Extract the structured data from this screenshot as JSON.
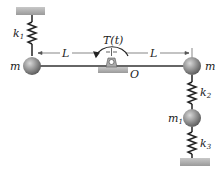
{
  "diagram": {
    "labels": {
      "k1": "k",
      "k1_sub": "1",
      "k2": "k",
      "k2_sub": "2",
      "k3": "k",
      "k3_sub": "3",
      "m_left": "m",
      "m_right": "m",
      "m1": "m",
      "m1_sub": "1",
      "L_left": "L",
      "L_right": "L",
      "torque": "T(t)",
      "pivot": "O"
    },
    "colors": {
      "ground": "#b8b8b8",
      "mass": "#8a8a8a",
      "line": "#222222"
    }
  }
}
